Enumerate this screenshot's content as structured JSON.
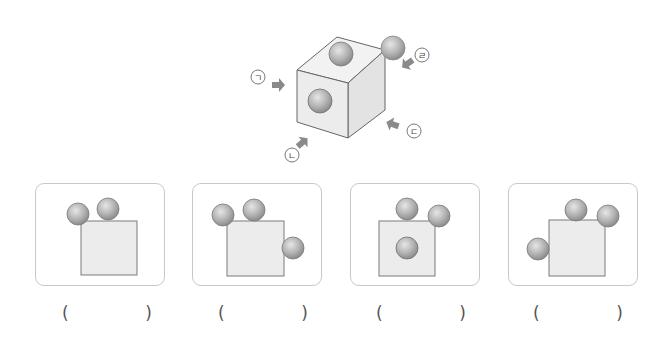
{
  "figure": {
    "labels": {
      "a": "ㄱ",
      "b": "ㄴ",
      "c": "ㄷ",
      "d": "ㄹ"
    },
    "colors": {
      "cube_face_front": "#ececec",
      "cube_face_top": "#f2f2f2",
      "cube_face_right": "#e4e4e4",
      "edge": "#666666",
      "ball": "#b5b5b5",
      "arrow": "#8a8a8a"
    }
  },
  "options": [
    {
      "id": 1,
      "answer": "",
      "open_paren": "(",
      "close_paren": ")"
    },
    {
      "id": 2,
      "answer": "",
      "open_paren": "(",
      "close_paren": ")"
    },
    {
      "id": 3,
      "answer": "",
      "open_paren": "(",
      "close_paren": ")"
    },
    {
      "id": 4,
      "answer": "",
      "open_paren": "(",
      "close_paren": ")"
    }
  ]
}
